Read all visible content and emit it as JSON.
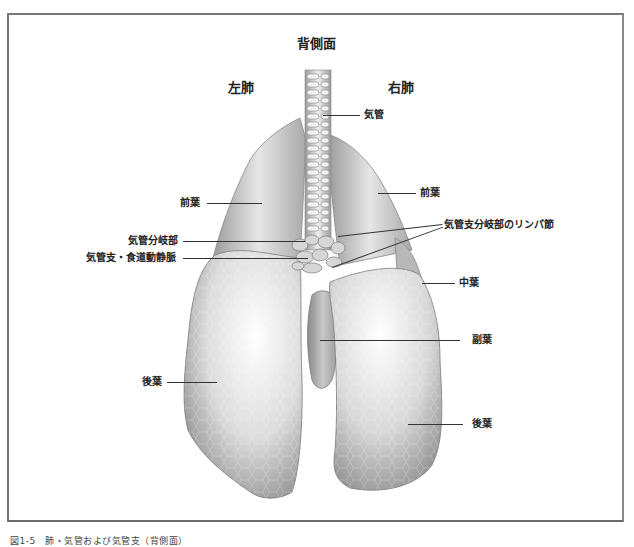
{
  "figure": {
    "view_title": "背側面",
    "side_labels": {
      "left": "左肺",
      "right": "右肺"
    },
    "labels": {
      "trachea": "気管",
      "left_cranial_lobe": "前葉",
      "right_cranial_lobe": "前葉",
      "tracheal_bifurcation": "気管分岐部",
      "bronchoesophageal_vessels": "気管支・食道動静脈",
      "tracheobronchial_lymph_nodes": "気管支分岐部のリンパ節",
      "right_middle_lobe": "中葉",
      "accessory_lobe": "副葉",
      "left_caudal_lobe": "後葉",
      "right_caudal_lobe": "後葉"
    },
    "caption": "図1-5　肺・気管および気管支（背側面）"
  },
  "colors": {
    "frame": "#777777",
    "line": "#333333",
    "lung_light": "#f2f2f2",
    "lung_dark": "#8a8a8a"
  }
}
